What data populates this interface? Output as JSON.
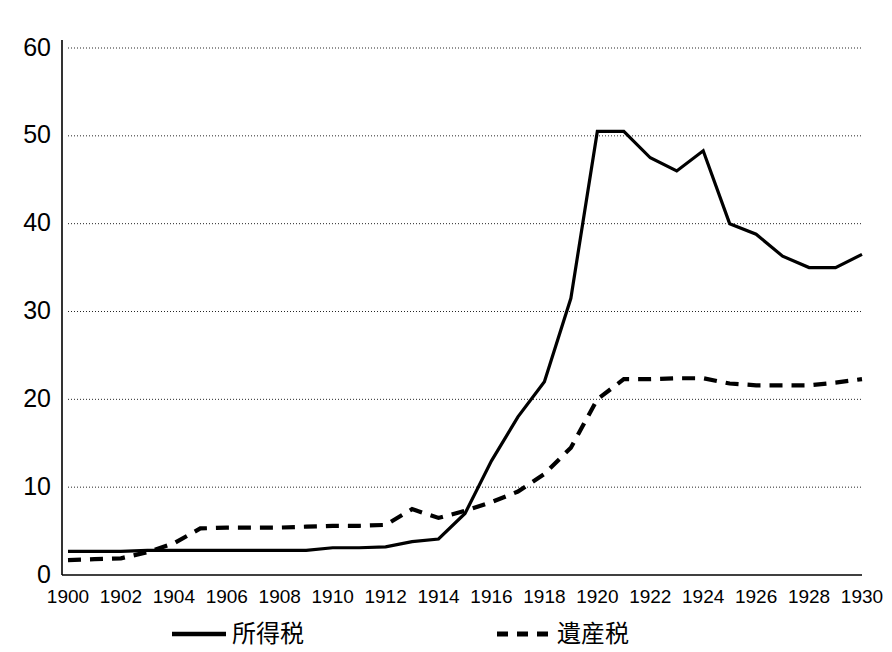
{
  "chart_data": {
    "type": "line",
    "title": "",
    "subtitle": "",
    "xlabel": "",
    "ylabel": "",
    "xlim": [
      1900,
      1930
    ],
    "ylim": [
      0,
      60
    ],
    "ytick_step": 10,
    "xtick_step": 2,
    "grid": true,
    "grid_axis": "y",
    "legend_position": "bottom",
    "x": [
      1900,
      1901,
      1902,
      1903,
      1904,
      1905,
      1906,
      1907,
      1908,
      1909,
      1910,
      1911,
      1912,
      1913,
      1914,
      1915,
      1916,
      1917,
      1918,
      1919,
      1920,
      1921,
      1922,
      1923,
      1924,
      1925,
      1926,
      1927,
      1928,
      1929,
      1930
    ],
    "ytick_labels": [
      "0",
      "10",
      "20",
      "30",
      "40",
      "50",
      "60"
    ],
    "ytick_values": [
      0,
      10,
      20,
      30,
      40,
      50,
      60
    ],
    "xtick_labels": [
      "1900",
      "1902",
      "1904",
      "1906",
      "1908",
      "1910",
      "1912",
      "1914",
      "1916",
      "1918",
      "1920",
      "1922",
      "1924",
      "1926",
      "1928",
      "1930"
    ],
    "xtick_values": [
      1900,
      1902,
      1904,
      1906,
      1908,
      1910,
      1912,
      1914,
      1916,
      1918,
      1920,
      1922,
      1924,
      1926,
      1928,
      1930
    ],
    "series": [
      {
        "name": "所得税",
        "style": "solid",
        "color": "#000000",
        "values": [
          2.7,
          2.7,
          2.7,
          2.8,
          2.8,
          2.8,
          2.8,
          2.8,
          2.8,
          2.8,
          3.1,
          3.1,
          3.2,
          3.8,
          4.1,
          7.0,
          13.0,
          18.0,
          22.0,
          31.5,
          50.5,
          50.5,
          47.5,
          46.0,
          48.3,
          40.0,
          38.8,
          36.3,
          35.0,
          35.0,
          36.5
        ]
      },
      {
        "name": "遺産税",
        "style": "dashed",
        "color": "#000000",
        "values": [
          1.7,
          1.8,
          1.9,
          2.6,
          3.6,
          5.3,
          5.4,
          5.4,
          5.4,
          5.5,
          5.6,
          5.6,
          5.7,
          7.5,
          6.5,
          7.3,
          8.3,
          9.5,
          11.5,
          14.5,
          20.0,
          22.3,
          22.3,
          22.4,
          22.4,
          21.8,
          21.6,
          21.6,
          21.6,
          21.9,
          22.3
        ]
      }
    ],
    "legend": [
      {
        "label": "所得税",
        "style": "solid"
      },
      {
        "label": "遺産税",
        "style": "dashed"
      }
    ]
  }
}
